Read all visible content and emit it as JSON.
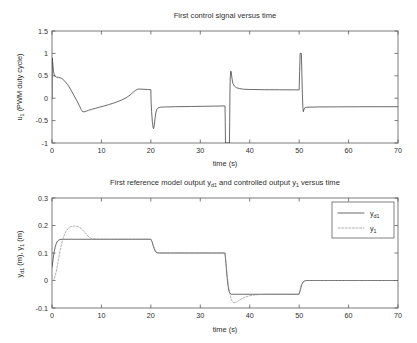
{
  "figure": {
    "background": "#ffffff",
    "line_color": "#3a3a3a",
    "dashed_color": "#8c8c8c",
    "axis_color": "#5a5a5a"
  },
  "chart_data": [
    {
      "type": "line",
      "id": "control-signal",
      "title": "First control signal versus time",
      "title_parts": [
        "First control signal versus time"
      ],
      "xlabel": "time (s)",
      "ylabel_parts": [
        "u",
        "1",
        " (PWM duty cycle)"
      ],
      "ylabel": "u_1 (PWM duty cycle)",
      "xlim": [
        0,
        70
      ],
      "ylim": [
        -1,
        1.5
      ],
      "xticks": [
        0,
        10,
        20,
        30,
        40,
        50,
        60,
        70
      ],
      "xtick_labels": [
        "0",
        "10",
        "20",
        "30",
        "40",
        "50",
        "60",
        "70"
      ],
      "yticks": [
        -1,
        -0.5,
        0,
        0.5,
        1,
        1.5
      ],
      "ytick_labels": [
        "-1",
        "-0.5",
        "0",
        "0.5",
        "1",
        "1.5"
      ],
      "grid": false,
      "legend": null,
      "series": [
        {
          "name": "u1",
          "style": "solid",
          "points": [
            [
              0.0,
              0.0
            ],
            [
              0.05,
              0.9
            ],
            [
              0.15,
              0.78
            ],
            [
              0.3,
              0.6
            ],
            [
              0.5,
              0.5
            ],
            [
              0.9,
              0.47
            ],
            [
              1.4,
              0.465
            ],
            [
              2.0,
              0.44
            ],
            [
              2.6,
              0.38
            ],
            [
              3.2,
              0.3
            ],
            [
              3.8,
              0.19
            ],
            [
              4.4,
              0.07
            ],
            [
              5.0,
              -0.05
            ],
            [
              5.5,
              -0.16
            ],
            [
              5.9,
              -0.25
            ],
            [
              6.2,
              -0.3
            ],
            [
              6.5,
              -0.305
            ],
            [
              6.9,
              -0.29
            ],
            [
              7.4,
              -0.27
            ],
            [
              8.0,
              -0.25
            ],
            [
              8.8,
              -0.225
            ],
            [
              9.6,
              -0.2
            ],
            [
              10.5,
              -0.175
            ],
            [
              11.4,
              -0.145
            ],
            [
              12.3,
              -0.115
            ],
            [
              13.2,
              -0.08
            ],
            [
              14.1,
              -0.04
            ],
            [
              15.0,
              0.01
            ],
            [
              15.8,
              0.07
            ],
            [
              16.4,
              0.13
            ],
            [
              16.9,
              0.175
            ],
            [
              17.3,
              0.2
            ],
            [
              17.7,
              0.205
            ],
            [
              18.4,
              0.2
            ],
            [
              19.3,
              0.195
            ],
            [
              19.95,
              0.19
            ],
            [
              20.0,
              0.19
            ],
            [
              20.05,
              -0.1
            ],
            [
              20.15,
              -0.3
            ],
            [
              20.3,
              -0.52
            ],
            [
              20.45,
              -0.65
            ],
            [
              20.55,
              -0.68
            ],
            [
              20.7,
              -0.6
            ],
            [
              20.85,
              -0.45
            ],
            [
              21.0,
              -0.33
            ],
            [
              21.2,
              -0.25
            ],
            [
              21.5,
              -0.215
            ],
            [
              22.0,
              -0.2
            ],
            [
              23.0,
              -0.195
            ],
            [
              25.0,
              -0.19
            ],
            [
              28.0,
              -0.185
            ],
            [
              31.0,
              -0.18
            ],
            [
              34.0,
              -0.175
            ],
            [
              34.9,
              -0.172
            ],
            [
              35.0,
              -0.172
            ],
            [
              35.05,
              -0.55
            ],
            [
              35.1,
              -1.0
            ],
            [
              35.9,
              -1.0
            ],
            [
              35.95,
              -0.55
            ],
            [
              36.0,
              0.1
            ],
            [
              36.05,
              0.45
            ],
            [
              36.15,
              0.6
            ],
            [
              36.25,
              0.6
            ],
            [
              36.4,
              0.45
            ],
            [
              36.6,
              0.33
            ],
            [
              36.9,
              0.27
            ],
            [
              37.3,
              0.235
            ],
            [
              37.9,
              0.215
            ],
            [
              38.8,
              0.2
            ],
            [
              40.0,
              0.195
            ],
            [
              43.0,
              0.19
            ],
            [
              46.0,
              0.188
            ],
            [
              49.0,
              0.186
            ],
            [
              49.95,
              0.185
            ],
            [
              50.0,
              0.185
            ],
            [
              50.1,
              0.6
            ],
            [
              50.2,
              1.0
            ],
            [
              50.45,
              1.0
            ],
            [
              50.55,
              0.55
            ],
            [
              50.65,
              0.1
            ],
            [
              50.75,
              -0.2
            ],
            [
              50.85,
              -0.3
            ],
            [
              50.95,
              -0.26
            ],
            [
              51.1,
              -0.22
            ],
            [
              51.4,
              -0.205
            ],
            [
              52.0,
              -0.2
            ],
            [
              54.0,
              -0.195
            ],
            [
              58.0,
              -0.193
            ],
            [
              62.0,
              -0.191
            ],
            [
              66.0,
              -0.19
            ],
            [
              70.0,
              -0.19
            ]
          ]
        }
      ]
    },
    {
      "type": "line",
      "id": "reference-model-output",
      "title": "First reference model output y_d1 and controlled output y_1 versus time",
      "title_parts": [
        "First reference model output y",
        "d1",
        " and controlled output y",
        "1",
        " versus time"
      ],
      "xlabel": "time (s)",
      "ylabel_parts": [
        "y",
        "d1",
        " (m), y",
        "1",
        " (m)"
      ],
      "ylabel": "y_d1 (m), y_1 (m)",
      "xlim": [
        0,
        70
      ],
      "ylim": [
        -0.1,
        0.3
      ],
      "xticks": [
        0,
        10,
        20,
        30,
        40,
        50,
        60,
        70
      ],
      "xtick_labels": [
        "0",
        "10",
        "20",
        "30",
        "40",
        "50",
        "60",
        "70"
      ],
      "yticks": [
        -0.1,
        0,
        0.1,
        0.2,
        0.3
      ],
      "ytick_labels": [
        "-0.1",
        "0",
        "0.1",
        "0.2",
        "0.3"
      ],
      "grid": false,
      "legend": {
        "position": "top-right",
        "entries": [
          {
            "label_parts": [
              "y",
              "d1"
            ],
            "label": "y_d1",
            "style": "solid"
          },
          {
            "label_parts": [
              "y",
              "1"
            ],
            "label": "y_1",
            "style": "dashed"
          }
        ]
      },
      "series": [
        {
          "name": "yd1",
          "style": "solid",
          "points": [
            [
              0.0,
              0.048
            ],
            [
              0.1,
              0.06
            ],
            [
              0.25,
              0.082
            ],
            [
              0.45,
              0.105
            ],
            [
              0.65,
              0.122
            ],
            [
              0.9,
              0.136
            ],
            [
              1.15,
              0.144
            ],
            [
              1.45,
              0.148
            ],
            [
              1.8,
              0.1495
            ],
            [
              2.3,
              0.15
            ],
            [
              4.0,
              0.15
            ],
            [
              8.0,
              0.15
            ],
            [
              12.0,
              0.15
            ],
            [
              16.0,
              0.15
            ],
            [
              19.9,
              0.15
            ],
            [
              20.0,
              0.15
            ],
            [
              20.25,
              0.141
            ],
            [
              20.5,
              0.125
            ],
            [
              20.75,
              0.112
            ],
            [
              21.0,
              0.104
            ],
            [
              21.3,
              0.1005
            ],
            [
              21.7,
              0.1
            ],
            [
              24.0,
              0.1
            ],
            [
              28.0,
              0.1
            ],
            [
              32.0,
              0.1
            ],
            [
              34.9,
              0.1
            ],
            [
              35.0,
              0.1
            ],
            [
              35.2,
              0.06
            ],
            [
              35.4,
              0.015
            ],
            [
              35.6,
              -0.018
            ],
            [
              35.8,
              -0.038
            ],
            [
              36.0,
              -0.047
            ],
            [
              36.3,
              -0.05
            ],
            [
              36.8,
              -0.05
            ],
            [
              40.0,
              -0.05
            ],
            [
              44.0,
              -0.05
            ],
            [
              48.0,
              -0.05
            ],
            [
              49.9,
              -0.05
            ],
            [
              50.0,
              -0.05
            ],
            [
              50.25,
              -0.032
            ],
            [
              50.5,
              -0.015
            ],
            [
              50.8,
              -0.005
            ],
            [
              51.2,
              -0.001
            ],
            [
              51.8,
              0.0
            ],
            [
              56.0,
              0.0
            ],
            [
              62.0,
              0.0
            ],
            [
              70.0,
              0.0
            ]
          ]
        },
        {
          "name": "y1",
          "style": "dashed",
          "points": [
            [
              0.0,
              0.0
            ],
            [
              0.2,
              0.0
            ],
            [
              0.45,
              0.006
            ],
            [
              0.7,
              0.02
            ],
            [
              1.0,
              0.045
            ],
            [
              1.3,
              0.075
            ],
            [
              1.6,
              0.105
            ],
            [
              1.9,
              0.13
            ],
            [
              2.2,
              0.15
            ],
            [
              2.5,
              0.166
            ],
            [
              2.8,
              0.178
            ],
            [
              3.2,
              0.188
            ],
            [
              3.6,
              0.194
            ],
            [
              4.0,
              0.197
            ],
            [
              4.5,
              0.198
            ],
            [
              5.0,
              0.197
            ],
            [
              5.5,
              0.194
            ],
            [
              6.0,
              0.188
            ],
            [
              6.4,
              0.18
            ],
            [
              6.8,
              0.172
            ],
            [
              7.1,
              0.165
            ],
            [
              7.4,
              0.159
            ],
            [
              7.7,
              0.155
            ],
            [
              8.1,
              0.152
            ],
            [
              8.6,
              0.1505
            ],
            [
              9.2,
              0.15
            ],
            [
              11.0,
              0.15
            ],
            [
              15.0,
              0.15
            ],
            [
              19.9,
              0.15
            ],
            [
              20.0,
              0.15
            ],
            [
              20.3,
              0.138
            ],
            [
              20.6,
              0.122
            ],
            [
              20.9,
              0.109
            ],
            [
              21.2,
              0.103
            ],
            [
              21.6,
              0.1005
            ],
            [
              22.1,
              0.1
            ],
            [
              26.0,
              0.1
            ],
            [
              31.0,
              0.1
            ],
            [
              34.9,
              0.1
            ],
            [
              35.0,
              0.1
            ],
            [
              35.25,
              0.055
            ],
            [
              35.5,
              0.01
            ],
            [
              35.75,
              -0.025
            ],
            [
              36.0,
              -0.05
            ],
            [
              36.25,
              -0.067
            ],
            [
              36.5,
              -0.077
            ],
            [
              36.8,
              -0.081
            ],
            [
              37.1,
              -0.08
            ],
            [
              37.5,
              -0.076
            ],
            [
              38.0,
              -0.07
            ],
            [
              38.6,
              -0.064
            ],
            [
              39.3,
              -0.059
            ],
            [
              40.1,
              -0.055
            ],
            [
              41.0,
              -0.0525
            ],
            [
              42.0,
              -0.051
            ],
            [
              43.5,
              -0.05
            ],
            [
              46.0,
              -0.05
            ],
            [
              49.9,
              -0.05
            ],
            [
              50.0,
              -0.05
            ],
            [
              50.3,
              -0.03
            ],
            [
              50.6,
              -0.012
            ],
            [
              50.9,
              -0.003
            ],
            [
              51.3,
              0.0
            ],
            [
              52.0,
              0.0
            ],
            [
              58.0,
              0.0
            ],
            [
              64.0,
              0.0
            ],
            [
              70.0,
              0.0
            ]
          ]
        }
      ]
    }
  ]
}
